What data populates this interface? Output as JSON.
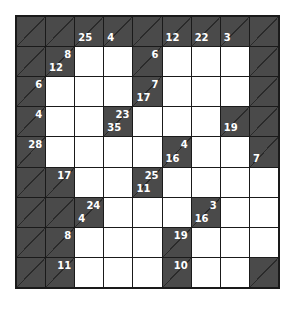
{
  "puzzle": {
    "type": "kakuro",
    "rows": 9,
    "cols": 9,
    "colors": {
      "clue_bg": "#4a4a4a",
      "grid_line": "#1a1a1a",
      "white_cell": "#ffffff",
      "clue_text": "#ffffff"
    },
    "grid": [
      [
        {
          "t": "b"
        },
        {
          "t": "b"
        },
        {
          "t": "c",
          "down": "25"
        },
        {
          "t": "c",
          "down": "4"
        },
        {
          "t": "b"
        },
        {
          "t": "c",
          "down": "12"
        },
        {
          "t": "c",
          "down": "22"
        },
        {
          "t": "c",
          "down": "3"
        },
        {
          "t": "b"
        }
      ],
      [
        {
          "t": "b"
        },
        {
          "t": "c",
          "across": "8",
          "down": "12"
        },
        {
          "t": "w"
        },
        {
          "t": "w"
        },
        {
          "t": "c",
          "across": "6"
        },
        {
          "t": "w"
        },
        {
          "t": "w"
        },
        {
          "t": "w"
        },
        {
          "t": "b"
        }
      ],
      [
        {
          "t": "c",
          "across": "6"
        },
        {
          "t": "w"
        },
        {
          "t": "w"
        },
        {
          "t": "w"
        },
        {
          "t": "c",
          "across": "7",
          "down": "17"
        },
        {
          "t": "w"
        },
        {
          "t": "w"
        },
        {
          "t": "w"
        },
        {
          "t": "b"
        }
      ],
      [
        {
          "t": "c",
          "across": "4"
        },
        {
          "t": "w"
        },
        {
          "t": "w"
        },
        {
          "t": "c",
          "across": "23",
          "down": "35"
        },
        {
          "t": "w"
        },
        {
          "t": "w"
        },
        {
          "t": "w"
        },
        {
          "t": "c",
          "down": "19"
        },
        {
          "t": "b"
        }
      ],
      [
        {
          "t": "c",
          "across": "28"
        },
        {
          "t": "w"
        },
        {
          "t": "w"
        },
        {
          "t": "w"
        },
        {
          "t": "w"
        },
        {
          "t": "c",
          "across": "4",
          "down": "16"
        },
        {
          "t": "w"
        },
        {
          "t": "w"
        },
        {
          "t": "c",
          "down": "7"
        }
      ],
      [
        {
          "t": "b"
        },
        {
          "t": "c",
          "across": "17"
        },
        {
          "t": "w"
        },
        {
          "t": "w"
        },
        {
          "t": "c",
          "across": "25",
          "down": "11"
        },
        {
          "t": "w"
        },
        {
          "t": "w"
        },
        {
          "t": "w"
        },
        {
          "t": "w"
        }
      ],
      [
        {
          "t": "b"
        },
        {
          "t": "b"
        },
        {
          "t": "c",
          "across": "24",
          "down": "4"
        },
        {
          "t": "w"
        },
        {
          "t": "w"
        },
        {
          "t": "w"
        },
        {
          "t": "c",
          "across": "3",
          "down": "16"
        },
        {
          "t": "w"
        },
        {
          "t": "w"
        }
      ],
      [
        {
          "t": "b"
        },
        {
          "t": "c",
          "across": "8"
        },
        {
          "t": "w"
        },
        {
          "t": "w"
        },
        {
          "t": "w"
        },
        {
          "t": "c",
          "across": "19"
        },
        {
          "t": "w"
        },
        {
          "t": "w"
        },
        {
          "t": "w"
        }
      ],
      [
        {
          "t": "b"
        },
        {
          "t": "c",
          "across": "11"
        },
        {
          "t": "w"
        },
        {
          "t": "w"
        },
        {
          "t": "w"
        },
        {
          "t": "c",
          "across": "10"
        },
        {
          "t": "w"
        },
        {
          "t": "w"
        },
        {
          "t": "b"
        }
      ]
    ]
  }
}
